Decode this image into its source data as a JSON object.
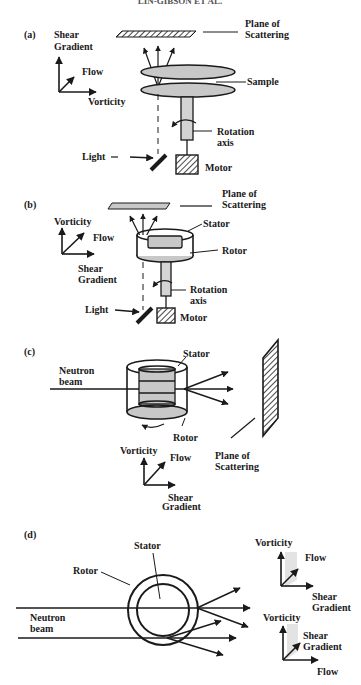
{
  "header": {
    "text": "LIN-GIBSON ET AL."
  },
  "colors": {
    "ink": "#1a1a1a",
    "fill_gray": "#c8c8c8",
    "light_gray": "#e3e3e3",
    "background": "#ffffff"
  },
  "panels": {
    "a": {
      "tag": "(a)",
      "plane_l1": "Plane of",
      "plane_l2": "Scattering",
      "axes": {
        "up_l1": "Shear",
        "up_l2": "Gradient",
        "diag": "Flow",
        "right": "Vorticity"
      },
      "sample": "Sample",
      "rotation_l1": "Rotation",
      "rotation_l2": "axis",
      "light": "Light",
      "motor": "Motor"
    },
    "b": {
      "tag": "(b)",
      "plane_l1": "Plane of",
      "plane_l2": "Scattering",
      "axes": {
        "up": "Vorticity",
        "diag": "Flow",
        "right_l1": "Shear",
        "right_l2": "Gradient"
      },
      "stator": "Stator",
      "rotor": "Rotor",
      "rotation_l1": "Rotation",
      "rotation_l2": "axis",
      "light": "Light",
      "motor": "Motor"
    },
    "c": {
      "tag": "(c)",
      "beam_l1": "Neutron",
      "beam_l2": "beam",
      "stator": "Stator",
      "rotor": "Rotor",
      "plane_l1": "Plane of",
      "plane_l2": "Scattering",
      "axes": {
        "up": "Vorticity",
        "diag": "Flow",
        "right_l1": "Shear",
        "right_l2": "Gradient"
      }
    },
    "d": {
      "tag": "(d)",
      "stator": "Stator",
      "rotor": "Rotor",
      "beam_l1": "Neutron",
      "beam_l2": "beam",
      "axes_top": {
        "up": "Vorticity",
        "diag": "Flow",
        "right_l1": "Shear",
        "right_l2": "Gradient"
      },
      "axes_bottom": {
        "up": "Vorticity",
        "diag_l1": "Shear",
        "diag_l2": "Gradient",
        "right": "Flow"
      }
    }
  }
}
